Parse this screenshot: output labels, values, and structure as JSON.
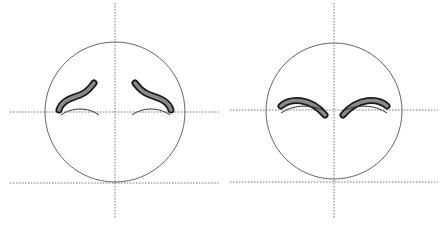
{
  "diagram": {
    "colors": {
      "outline": "#555555",
      "guide": "#777777",
      "brow_fill": "#8a8a8a",
      "brow_stroke": "#1a1a1a",
      "background": "#ffffff"
    },
    "faces": [
      {
        "name": "worried-face",
        "expression": "worried / sad raised inner brows",
        "circle": {
          "cx": 115,
          "cy": 112,
          "r": 70
        },
        "vertical_guide": {
          "x": 115,
          "y1": 3,
          "y2": 218
        },
        "horizontal_guides": [
          {
            "y": 112,
            "x1": 10,
            "x2": 220
          },
          {
            "y": 183,
            "x1": 10,
            "x2": 220
          }
        ]
      },
      {
        "name": "arched-brows-face",
        "expression": "neutral / furrowed arched brows",
        "circle": {
          "cx": 334,
          "cy": 111,
          "r": 68
        },
        "vertical_guide": {
          "x": 334,
          "y1": 3,
          "y2": 218
        },
        "horizontal_guides": [
          {
            "y": 110,
            "x1": 230,
            "x2": 438
          },
          {
            "y": 182,
            "x1": 230,
            "x2": 438
          }
        ]
      }
    ]
  }
}
